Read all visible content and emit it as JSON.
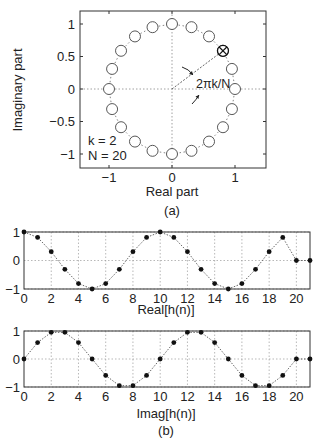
{
  "chart_data": [
    {
      "type": "scatter",
      "panel": "a",
      "title": "",
      "xlabel": "Real part",
      "ylabel": "Imaginary part",
      "xlim": [
        -1.5,
        1.5
      ],
      "ylim": [
        -1.2,
        1.2
      ],
      "xticks": [
        -1,
        0,
        1
      ],
      "xtick_labels": [
        "−1",
        "0",
        "1"
      ],
      "yticks": [
        -1,
        -0.5,
        0,
        0.5,
        1
      ],
      "ytick_labels": [
        "−1",
        "−0.5",
        "0",
        "0.5",
        "1"
      ],
      "grid": "axes lines only (dotted x=0, y=0)",
      "N": 20,
      "k": 2,
      "points_description": "20 unit-circle roots of unity e^{j2πn/N}, n=0..19, open circles joined by dotted line",
      "highlighted_point": {
        "index": 2,
        "x": 0.809,
        "y": 0.588,
        "marker": "circle-cross"
      },
      "annotations": [
        {
          "text": "2πk/N",
          "x": 0.55,
          "y": 0.12
        },
        {
          "text": "k = 2",
          "x": -1.25,
          "y": -0.78
        },
        {
          "text": "N = 20",
          "x": -1.25,
          "y": -1.0
        }
      ],
      "caption": "(a)"
    },
    {
      "type": "line",
      "panel": "b-top",
      "xlabel": "Real[h(n)]",
      "ylabel": "",
      "xlim": [
        0,
        21
      ],
      "ylim": [
        -1,
        1
      ],
      "xticks": [
        0,
        2,
        4,
        6,
        8,
        10,
        12,
        14,
        16,
        18,
        20
      ],
      "yticks": [
        -1,
        0,
        1
      ],
      "ytick_labels": [
        "−1",
        "0",
        "1"
      ],
      "grid": true,
      "x": [
        0,
        1,
        2,
        3,
        4,
        5,
        6,
        7,
        8,
        9,
        10,
        11,
        12,
        13,
        14,
        15,
        16,
        17,
        18,
        19,
        20,
        21
      ],
      "values": [
        1,
        0.809,
        0.309,
        -0.309,
        -0.809,
        -1,
        -0.809,
        -0.309,
        0.309,
        0.809,
        1,
        0.809,
        0.309,
        -0.309,
        -0.809,
        -1,
        -0.809,
        -0.309,
        0.309,
        0.809,
        0,
        0
      ]
    },
    {
      "type": "line",
      "panel": "b-bottom",
      "xlabel": "Imag[h(n)]",
      "ylabel": "",
      "xlim": [
        0,
        21
      ],
      "ylim": [
        -1,
        1
      ],
      "xticks": [
        0,
        2,
        4,
        6,
        8,
        10,
        12,
        14,
        16,
        18,
        20
      ],
      "yticks": [
        -1,
        0,
        1
      ],
      "ytick_labels": [
        "−1",
        "0",
        "1"
      ],
      "grid": true,
      "x": [
        0,
        1,
        2,
        3,
        4,
        5,
        6,
        7,
        8,
        9,
        10,
        11,
        12,
        13,
        14,
        15,
        16,
        17,
        18,
        19,
        20,
        21
      ],
      "values": [
        0,
        0.588,
        0.951,
        0.951,
        0.588,
        0,
        -0.588,
        -0.951,
        -0.951,
        -0.588,
        0,
        0.588,
        0.951,
        0.951,
        0.588,
        0,
        -0.588,
        -0.951,
        -0.951,
        -0.588,
        0,
        0
      ],
      "caption": "(b)"
    }
  ],
  "labels": {
    "a_xlabel": "Real part",
    "a_ylabel": "Imaginary part",
    "a_caption": "(a)",
    "angle_label": "2πk/N",
    "k_label": "k = 2",
    "n_label": "N = 20",
    "b_top_xlabel": "Real[h(n)]",
    "b_bottom_xlabel": "Imag[h(n)]",
    "b_caption": "(b)"
  }
}
